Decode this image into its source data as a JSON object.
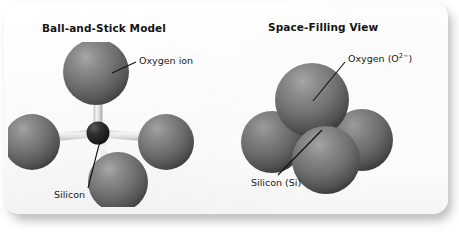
{
  "figure": {
    "background_color": "#ffffff",
    "card_color": "#fdfdfd",
    "sphere_color": "#6e6e6e",
    "sphere_highlight_color": "#9d9d9d",
    "sphere_shadow_color": "#3c3c3c",
    "bond_color": "#e6e6e6",
    "silicon_center_color": "#2a2a2a",
    "text_color": "#141414",
    "leader_line_color": "#111111"
  },
  "panels": [
    {
      "id": "ball-and-stick",
      "title": "Ball-and-Stick Model",
      "labels": [
        {
          "id": "oxygen-ion",
          "text": "Oxygen ion"
        },
        {
          "id": "silicon",
          "text": "Silicon"
        }
      ]
    },
    {
      "id": "space-filling",
      "title": "Space-Filling View",
      "labels": [
        {
          "id": "oxygen-o2",
          "text_prefix": "Oxygen (O",
          "text_superscript": "2−",
          "text_suffix": ")",
          "text_full": "Oxygen (O2−)"
        },
        {
          "id": "silicon-si",
          "text": "Silicon (Si)"
        }
      ]
    }
  ],
  "diagram": {
    "ball_and_stick": {
      "center_atom": "Silicon",
      "outer_atoms": "Oxygen ion",
      "outer_atom_count": 4,
      "bond_count": 4,
      "geometry": "tetrahedral"
    },
    "space_filling": {
      "sphere_count": 4,
      "sphere_label": "Oxygen",
      "hidden_atom_label": "Silicon (Si)",
      "geometry": "tetrahedral close-packed"
    }
  }
}
